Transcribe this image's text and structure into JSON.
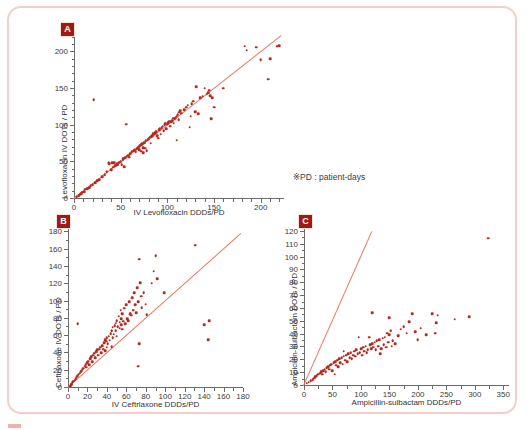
{
  "figure": {
    "note": "※PD : patient-days",
    "marker_color": "#b42a20",
    "line_color": "#e8775f",
    "frame_color": "#f4cfc9",
    "tag_color": "#9e1b14"
  },
  "chart_data": [
    {
      "type": "scatter",
      "panel": "A",
      "title": "",
      "xlabel": "IV Levofloxacin DDDs/PD",
      "ylabel": "Levofloxacin IV DOTs / PD",
      "xlim": [
        0,
        225
      ],
      "ylim": [
        0,
        225
      ],
      "xticks": [
        0,
        50,
        100,
        150,
        200
      ],
      "yticks": [
        0,
        50,
        100,
        150,
        200
      ],
      "xminor_step": 10,
      "yminor_step": 10,
      "grid": false,
      "legend": "none",
      "reference_line": {
        "type": "identity",
        "from": [
          0,
          0
        ],
        "to": [
          222,
          222
        ]
      },
      "points": [
        [
          3,
          3
        ],
        [
          5,
          4
        ],
        [
          6,
          6
        ],
        [
          8,
          7
        ],
        [
          9,
          9
        ],
        [
          11,
          10
        ],
        [
          12,
          13
        ],
        [
          14,
          14
        ],
        [
          16,
          15
        ],
        [
          18,
          18
        ],
        [
          20,
          19
        ],
        [
          21,
          135
        ],
        [
          23,
          22
        ],
        [
          25,
          25
        ],
        [
          27,
          26
        ],
        [
          30,
          30
        ],
        [
          33,
          33
        ],
        [
          35,
          37
        ],
        [
          37,
          49
        ],
        [
          38,
          48
        ],
        [
          40,
          40
        ],
        [
          41,
          49
        ],
        [
          42,
          43
        ],
        [
          43,
          49
        ],
        [
          44,
          45
        ],
        [
          45,
          46
        ],
        [
          46,
          48
        ],
        [
          47,
          47
        ],
        [
          48,
          49
        ],
        [
          49,
          50
        ],
        [
          50,
          51
        ],
        [
          51,
          47
        ],
        [
          52,
          53
        ],
        [
          53,
          55
        ],
        [
          54,
          44
        ],
        [
          55,
          56
        ],
        [
          56,
          102
        ],
        [
          57,
          58
        ],
        [
          58,
          59
        ],
        [
          59,
          57
        ],
        [
          60,
          62
        ],
        [
          62,
          64
        ],
        [
          63,
          65
        ],
        [
          64,
          66
        ],
        [
          65,
          67
        ],
        [
          66,
          64
        ],
        [
          67,
          68
        ],
        [
          68,
          69
        ],
        [
          69,
          70
        ],
        [
          70,
          67
        ],
        [
          70,
          72
        ],
        [
          71,
          73
        ],
        [
          72,
          65
        ],
        [
          72,
          74
        ],
        [
          73,
          75
        ],
        [
          74,
          63
        ],
        [
          74,
          70
        ],
        [
          75,
          77
        ],
        [
          76,
          69
        ],
        [
          77,
          79
        ],
        [
          78,
          66
        ],
        [
          79,
          81
        ],
        [
          80,
          82
        ],
        [
          81,
          84
        ],
        [
          82,
          76
        ],
        [
          83,
          85
        ],
        [
          84,
          86
        ],
        [
          85,
          89
        ],
        [
          86,
          88
        ],
        [
          87,
          90
        ],
        [
          88,
          92
        ],
        [
          89,
          86
        ],
        [
          90,
          83
        ],
        [
          91,
          94
        ],
        [
          92,
          96
        ],
        [
          93,
          88
        ],
        [
          94,
          97
        ],
        [
          95,
          99
        ],
        [
          96,
          93
        ],
        [
          97,
          101
        ],
        [
          98,
          103
        ],
        [
          99,
          96
        ],
        [
          100,
          102
        ],
        [
          101,
          104
        ],
        [
          102,
          106
        ],
        [
          103,
          99
        ],
        [
          104,
          105
        ],
        [
          105,
          107
        ],
        [
          106,
          110
        ],
        [
          107,
          103
        ],
        [
          108,
          109
        ],
        [
          109,
          111
        ],
        [
          110,
          80
        ],
        [
          110,
          113
        ],
        [
          111,
          115
        ],
        [
          112,
          108
        ],
        [
          113,
          118
        ],
        [
          114,
          120
        ],
        [
          115,
          117
        ],
        [
          118,
          122
        ],
        [
          120,
          125
        ],
        [
          122,
          128
        ],
        [
          124,
          98
        ],
        [
          125,
          113
        ],
        [
          126,
          130
        ],
        [
          128,
          133
        ],
        [
          130,
          119
        ],
        [
          131,
          153
        ],
        [
          133,
          116
        ],
        [
          135,
          138
        ],
        [
          138,
          140
        ],
        [
          140,
          151
        ],
        [
          142,
          143
        ],
        [
          144,
          145
        ],
        [
          145,
          148
        ],
        [
          146,
          141
        ],
        [
          147,
          109
        ],
        [
          148,
          138
        ],
        [
          150,
          125
        ],
        [
          160,
          151
        ],
        [
          183,
          208
        ],
        [
          185,
          203
        ],
        [
          195,
          207
        ],
        [
          200,
          190
        ],
        [
          208,
          163
        ],
        [
          210,
          191
        ],
        [
          218,
          208
        ],
        [
          220,
          209
        ]
      ]
    },
    {
      "type": "scatter",
      "panel": "B",
      "title": "",
      "xlabel": "IV Ceftriaxone DDDs/PD",
      "ylabel": "Ceftriaxone IV DOTs / PD",
      "xlim": [
        0,
        180
      ],
      "ylim": [
        0,
        185
      ],
      "xticks": [
        0,
        20,
        40,
        60,
        80,
        100,
        120,
        140,
        160,
        180
      ],
      "yticks": [
        0,
        20,
        40,
        60,
        80,
        100,
        120,
        140,
        160,
        180
      ],
      "xminor_step": 10,
      "yminor_step": 10,
      "grid": false,
      "legend": "none",
      "reference_line": {
        "type": "identity",
        "from": [
          0,
          0
        ],
        "to": [
          178,
          178
        ]
      },
      "points": [
        [
          2,
          2
        ],
        [
          3,
          4
        ],
        [
          4,
          5
        ],
        [
          5,
          7
        ],
        [
          6,
          8
        ],
        [
          7,
          9
        ],
        [
          8,
          11
        ],
        [
          9,
          13
        ],
        [
          10,
          74
        ],
        [
          10,
          14
        ],
        [
          11,
          16
        ],
        [
          12,
          17
        ],
        [
          13,
          19
        ],
        [
          14,
          20
        ],
        [
          15,
          22
        ],
        [
          16,
          23
        ],
        [
          17,
          25
        ],
        [
          18,
          27
        ],
        [
          19,
          24
        ],
        [
          20,
          29
        ],
        [
          21,
          31
        ],
        [
          22,
          27
        ],
        [
          23,
          34
        ],
        [
          24,
          36
        ],
        [
          25,
          30
        ],
        [
          26,
          38
        ],
        [
          27,
          40
        ],
        [
          28,
          35
        ],
        [
          29,
          42
        ],
        [
          30,
          44
        ],
        [
          31,
          38
        ],
        [
          32,
          45
        ],
        [
          33,
          47
        ],
        [
          34,
          41
        ],
        [
          35,
          49
        ],
        [
          36,
          45
        ],
        [
          37,
          52
        ],
        [
          38,
          43
        ],
        [
          38,
          56
        ],
        [
          39,
          54
        ],
        [
          40,
          47
        ],
        [
          40,
          58
        ],
        [
          41,
          51
        ],
        [
          42,
          60
        ],
        [
          43,
          55
        ],
        [
          44,
          63
        ],
        [
          45,
          48
        ],
        [
          45,
          66
        ],
        [
          46,
          58
        ],
        [
          46,
          70
        ],
        [
          47,
          62
        ],
        [
          48,
          72
        ],
        [
          49,
          66
        ],
        [
          49,
          75
        ],
        [
          50,
          60
        ],
        [
          50,
          78
        ],
        [
          51,
          71
        ],
        [
          52,
          83
        ],
        [
          53,
          69
        ],
        [
          53,
          76
        ],
        [
          54,
          90
        ],
        [
          55,
          73
        ],
        [
          55,
          80
        ],
        [
          56,
          68
        ],
        [
          56,
          86
        ],
        [
          57,
          77
        ],
        [
          58,
          92
        ],
        [
          59,
          74
        ],
        [
          60,
          96
        ],
        [
          61,
          80
        ],
        [
          62,
          78
        ],
        [
          63,
          100
        ],
        [
          64,
          86
        ],
        [
          65,
          84
        ],
        [
          66,
          104
        ],
        [
          67,
          90
        ],
        [
          68,
          110
        ],
        [
          69,
          96
        ],
        [
          70,
          87
        ],
        [
          71,
          116
        ],
        [
          72,
          25
        ],
        [
          72,
          100
        ],
        [
          73,
          149
        ],
        [
          73,
          51
        ],
        [
          74,
          122
        ],
        [
          75,
          106
        ],
        [
          76,
          93
        ],
        [
          78,
          110
        ],
        [
          80,
          97
        ],
        [
          81,
          85
        ],
        [
          86,
          121
        ],
        [
          88,
          135
        ],
        [
          90,
          153
        ],
        [
          92,
          126
        ],
        [
          99,
          110
        ],
        [
          131,
          165
        ],
        [
          140,
          73
        ],
        [
          144,
          56
        ],
        [
          145,
          78
        ]
      ]
    },
    {
      "type": "scatter",
      "panel": "C",
      "title": "",
      "xlabel": "Ampicillin-sulbactam DDDs/PD",
      "ylabel": "Ampicillin-sulbactam DOTs / PD",
      "xlim": [
        0,
        360
      ],
      "ylim": [
        0,
        123
      ],
      "xticks": [
        0,
        50,
        100,
        150,
        200,
        250,
        300,
        350
      ],
      "yticks": [
        0,
        10,
        20,
        30,
        40,
        50,
        60,
        70,
        80,
        90,
        100,
        110,
        120
      ],
      "xminor_step": 25,
      "yminor_step": 5,
      "grid": false,
      "legend": "none",
      "reference_line": {
        "type": "identity",
        "from": [
          0,
          0
        ],
        "to": [
          120,
          120
        ]
      },
      "points": [
        [
          5,
          2
        ],
        [
          8,
          3
        ],
        [
          12,
          4
        ],
        [
          15,
          5
        ],
        [
          18,
          6
        ],
        [
          20,
          7
        ],
        [
          22,
          8
        ],
        [
          25,
          9
        ],
        [
          28,
          10
        ],
        [
          30,
          11
        ],
        [
          32,
          9
        ],
        [
          34,
          12
        ],
        [
          36,
          13
        ],
        [
          38,
          11
        ],
        [
          40,
          14
        ],
        [
          42,
          15
        ],
        [
          44,
          13
        ],
        [
          46,
          16
        ],
        [
          48,
          17
        ],
        [
          50,
          12
        ],
        [
          52,
          18
        ],
        [
          54,
          9
        ],
        [
          55,
          19
        ],
        [
          57,
          16
        ],
        [
          58,
          20
        ],
        [
          60,
          15
        ],
        [
          62,
          21
        ],
        [
          64,
          18
        ],
        [
          66,
          22
        ],
        [
          68,
          17
        ],
        [
          70,
          27
        ],
        [
          70,
          23
        ],
        [
          72,
          20
        ],
        [
          74,
          24
        ],
        [
          76,
          19
        ],
        [
          78,
          25
        ],
        [
          80,
          22
        ],
        [
          82,
          26
        ],
        [
          84,
          21
        ],
        [
          86,
          24
        ],
        [
          88,
          27
        ],
        [
          90,
          23
        ],
        [
          92,
          28
        ],
        [
          94,
          25
        ],
        [
          96,
          38
        ],
        [
          98,
          26
        ],
        [
          100,
          29
        ],
        [
          102,
          24
        ],
        [
          104,
          30
        ],
        [
          106,
          27
        ],
        [
          108,
          31
        ],
        [
          110,
          26
        ],
        [
          112,
          28
        ],
        [
          114,
          38
        ],
        [
          116,
          32
        ],
        [
          118,
          29
        ],
        [
          120,
          57
        ],
        [
          120,
          33
        ],
        [
          122,
          30
        ],
        [
          124,
          34
        ],
        [
          126,
          28
        ],
        [
          128,
          35
        ],
        [
          130,
          31
        ],
        [
          132,
          36
        ],
        [
          134,
          25
        ],
        [
          136,
          29
        ],
        [
          138,
          37
        ],
        [
          140,
          32
        ],
        [
          142,
          38
        ],
        [
          144,
          30
        ],
        [
          146,
          41
        ],
        [
          148,
          34
        ],
        [
          150,
          53
        ],
        [
          150,
          40
        ],
        [
          152,
          43
        ],
        [
          154,
          31
        ],
        [
          156,
          35
        ],
        [
          160,
          33
        ],
        [
          165,
          39
        ],
        [
          170,
          44
        ],
        [
          175,
          46
        ],
        [
          180,
          41
        ],
        [
          185,
          50
        ],
        [
          190,
          56
        ],
        [
          195,
          42
        ],
        [
          200,
          36
        ],
        [
          205,
          45
        ],
        [
          215,
          40
        ],
        [
          225,
          56
        ],
        [
          230,
          41
        ],
        [
          232,
          49
        ],
        [
          235,
          55
        ],
        [
          265,
          52
        ],
        [
          290,
          54
        ],
        [
          323,
          115
        ]
      ]
    }
  ]
}
